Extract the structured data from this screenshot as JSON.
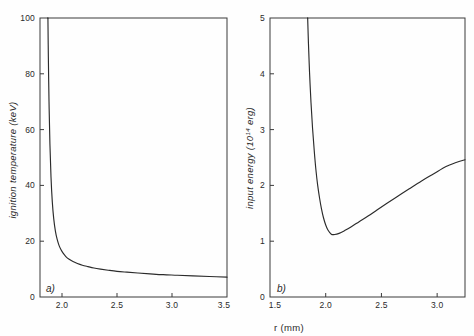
{
  "figure": {
    "shared_xlabel": "r (mm)",
    "background_color": "#fefefe",
    "line_color": "#2b2b2b",
    "axis_color": "#3a3a3a"
  },
  "chart_data": [
    {
      "type": "line",
      "panel_label": "a)",
      "title": "",
      "xlabel": "r (mm)",
      "ylabel": "ignition temperature (keV)",
      "ylabel_unit": "keV",
      "xlim": [
        1.8,
        3.5
      ],
      "ylim": [
        0,
        100
      ],
      "grid": false,
      "legend": "none",
      "xticks": [
        2.0,
        2.5,
        3.0,
        3.5
      ],
      "xticklabels": [
        "2.0",
        "2.5",
        "3.0",
        "3.5"
      ],
      "yticks": [
        0,
        20,
        40,
        60,
        80,
        100
      ],
      "yticklabels": [
        "0",
        "20",
        "40",
        "60",
        "80",
        "100"
      ],
      "asymptote_x": 1.87,
      "x": [
        1.872,
        1.876,
        1.882,
        1.89,
        1.9,
        1.912,
        1.925,
        1.94,
        1.955,
        1.972,
        1.99,
        2.01,
        2.035,
        2.065,
        2.1,
        2.14,
        2.185,
        2.235,
        2.29,
        2.35,
        2.42,
        2.5,
        2.59,
        2.69,
        2.8,
        2.92,
        3.05,
        3.19,
        3.34,
        3.5
      ],
      "y": [
        100.0,
        86.0,
        70.0,
        55.0,
        43.0,
        34.0,
        28.0,
        23.6,
        20.8,
        18.6,
        17.0,
        15.7,
        14.5,
        13.5,
        12.7,
        12.0,
        11.4,
        10.9,
        10.4,
        10.0,
        9.6,
        9.2,
        8.9,
        8.6,
        8.3,
        8.0,
        7.8,
        7.55,
        7.35,
        7.1
      ]
    },
    {
      "type": "line",
      "panel_label": "b)",
      "title": "",
      "xlabel": "r (mm)",
      "ylabel": "input energy (10^14 erg)",
      "ylabel_prefix": "input energy (10",
      "ylabel_exponent": "14",
      "ylabel_suffix": " erg)",
      "xlim": [
        1.5,
        3.25
      ],
      "ylim": [
        0,
        5
      ],
      "grid": false,
      "legend": "none",
      "xticks": [
        1.5,
        2.0,
        2.5,
        3.0
      ],
      "xticklabels": [
        "1.5",
        "2.0",
        "2.5",
        "3.0"
      ],
      "yticks": [
        0,
        1,
        2,
        3,
        4,
        5
      ],
      "yticklabels": [
        "0",
        "1",
        "2",
        "3",
        "4",
        "5"
      ],
      "minimum_x": 2.05,
      "minimum_y": 1.12,
      "x": [
        1.838,
        1.845,
        1.855,
        1.868,
        1.882,
        1.897,
        1.912,
        1.928,
        1.945,
        1.962,
        1.98,
        2.0,
        2.02,
        2.05,
        2.08,
        2.12,
        2.17,
        2.23,
        2.3,
        2.38,
        2.46,
        2.55,
        2.65,
        2.75,
        2.86,
        2.97,
        3.08,
        3.17,
        3.25
      ],
      "y": [
        5.0,
        4.55,
        4.02,
        3.48,
        3.02,
        2.62,
        2.28,
        2.0,
        1.77,
        1.58,
        1.42,
        1.29,
        1.2,
        1.125,
        1.12,
        1.14,
        1.19,
        1.26,
        1.35,
        1.45,
        1.56,
        1.68,
        1.81,
        1.94,
        2.08,
        2.21,
        2.34,
        2.41,
        2.46
      ]
    }
  ]
}
